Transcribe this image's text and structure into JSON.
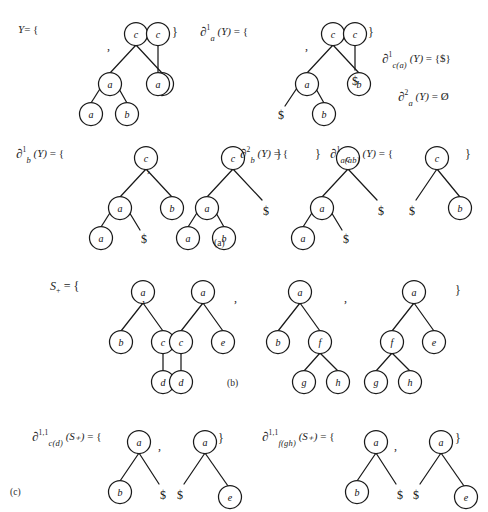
{
  "figure": {
    "title_absent": true,
    "background_color": "#ffffff",
    "ink_color": "#1a1a1a",
    "node_label_style": "italic-serif",
    "end_marker": "$",
    "empty_set_symbol": "Ø"
  },
  "panels": [
    {
      "id": "a",
      "caption": "(a)",
      "rows": [
        {
          "entries": [
            {
              "label": {
                "base": "Y",
                "sup": "",
                "sub": "",
                "arg": "",
                "eq": "= {"
              },
              "label_text": "Y = {",
              "trees": [
                {
                  "nodes": [
                    {
                      "id": "n1",
                      "label": "c",
                      "x": 62,
                      "y": 10
                    },
                    {
                      "id": "n2",
                      "label": "a",
                      "x": 36,
                      "y": 45
                    },
                    {
                      "id": "n3",
                      "label": "b",
                      "x": 92,
                      "y": 45
                    },
                    {
                      "id": "n4",
                      "label": "a",
                      "x": 17,
                      "y": 82
                    },
                    {
                      "id": "n5",
                      "label": "b",
                      "x": 53,
                      "y": 82
                    }
                  ],
                  "edges": [
                    [
                      "n1",
                      "n2"
                    ],
                    [
                      "n1",
                      "n3"
                    ],
                    [
                      "n2",
                      "n4"
                    ],
                    [
                      "n2",
                      "n5"
                    ]
                  ]
                },
                {
                  "nodes": [
                    {
                      "id": "m1",
                      "label": "c",
                      "x": 12,
                      "y": 10
                    },
                    {
                      "id": "m2",
                      "label": "a",
                      "x": 12,
                      "y": 45
                    }
                  ],
                  "edges": [
                    [
                      "m1",
                      "m2"
                    ]
                  ]
                }
              ],
              "separators": [
                ","
              ],
              "closing": "}"
            },
            {
              "label_text": "∂¹a (Y) = {",
              "label": {
                "base": "∂",
                "sup": "1",
                "sub": "a",
                "arg": "(Y)",
                "eq": "= {"
              },
              "trees": [
                {
                  "nodes": [
                    {
                      "id": "p1",
                      "label": "c",
                      "x": 62,
                      "y": 10
                    },
                    {
                      "id": "p2",
                      "label": "a",
                      "x": 36,
                      "y": 45
                    },
                    {
                      "id": "p3",
                      "label": "b",
                      "x": 92,
                      "y": 45
                    },
                    {
                      "id": "p4",
                      "label": "$",
                      "x": 14,
                      "y": 82,
                      "leaf": true
                    },
                    {
                      "id": "p5",
                      "label": "b",
                      "x": 53,
                      "y": 82
                    }
                  ],
                  "edges": [
                    [
                      "p1",
                      "p2"
                    ],
                    [
                      "p1",
                      "p3"
                    ],
                    [
                      "p2",
                      "p4"
                    ],
                    [
                      "p2",
                      "p5"
                    ]
                  ]
                },
                {
                  "nodes": [
                    {
                      "id": "q1",
                      "label": "c",
                      "x": 12,
                      "y": 10
                    },
                    {
                      "id": "q2",
                      "label": "$",
                      "x": 12,
                      "y": 45,
                      "leaf": true
                    }
                  ],
                  "edges": [
                    [
                      "q1",
                      "q2"
                    ]
                  ]
                }
              ],
              "separators": [
                ","
              ],
              "closing": "}"
            }
          ]
        }
      ],
      "side_equations": [
        {
          "label": {
            "base": "∂",
            "sup": "1",
            "sub": "c(a)",
            "arg": "(Y)"
          },
          "rhs": "= {$}",
          "text": "∂¹c(a) (Y) = {$}"
        },
        {
          "label": {
            "base": "∂",
            "sup": "2",
            "sub": "a",
            "arg": "(Y)"
          },
          "rhs": "= Ø",
          "text": "∂²a (Y) = Ø"
        }
      ],
      "row2": [
        {
          "label_text": "∂¹b (Y) = {",
          "label": {
            "base": "∂",
            "sup": "1",
            "sub": "b",
            "arg": "(Y)",
            "eq": "= {"
          },
          "trees": [
            {
              "nodes": [
                {
                  "id": "r1",
                  "label": "c",
                  "x": 62,
                  "y": 10
                },
                {
                  "id": "r2",
                  "label": "a",
                  "x": 36,
                  "y": 45
                },
                {
                  "id": "r3",
                  "label": "b",
                  "x": 92,
                  "y": 45
                },
                {
                  "id": "r4",
                  "label": "a",
                  "x": 17,
                  "y": 82
                },
                {
                  "id": "r5",
                  "label": "$",
                  "x": 52,
                  "y": 84,
                  "leaf": true
                }
              ],
              "edges": [
                [
                  "r1",
                  "r2"
                ],
                [
                  "r1",
                  "r3"
                ],
                [
                  "r2",
                  "r4"
                ],
                [
                  "r2",
                  "r5"
                ]
              ]
            },
            {
              "nodes": [
                {
                  "id": "s1",
                  "label": "c",
                  "x": 62,
                  "y": 10
                },
                {
                  "id": "s2",
                  "label": "a",
                  "x": 36,
                  "y": 45
                },
                {
                  "id": "s3",
                  "label": "$",
                  "x": 94,
                  "y": 50,
                  "leaf": true
                },
                {
                  "id": "s4",
                  "label": "a",
                  "x": 17,
                  "y": 82
                },
                {
                  "id": "s5",
                  "label": "b",
                  "x": 53,
                  "y": 82
                }
              ],
              "edges": [
                [
                  "s1",
                  "s2"
                ],
                [
                  "s1",
                  "s3"
                ],
                [
                  "s2",
                  "s4"
                ],
                [
                  "s2",
                  "s5"
                ]
              ]
            }
          ],
          "separators": [
            ","
          ],
          "closing": "}"
        },
        {
          "label_text": "∂²b (Y) = {",
          "label": {
            "base": "∂",
            "sup": "2",
            "sub": "b",
            "arg": "(Y)",
            "eq": "= {"
          },
          "trees": [
            {
              "nodes": [
                {
                  "id": "t1",
                  "label": "c",
                  "x": 48,
                  "y": 10
                },
                {
                  "id": "t2",
                  "label": "a",
                  "x": 22,
                  "y": 45
                },
                {
                  "id": "t3",
                  "label": "$",
                  "x": 80,
                  "y": 50,
                  "leaf": true
                },
                {
                  "id": "t4",
                  "label": "a",
                  "x": 6,
                  "y": 82
                },
                {
                  "id": "t5",
                  "label": "$",
                  "x": 40,
                  "y": 84,
                  "leaf": true
                }
              ],
              "edges": [
                [
                  "t1",
                  "t2"
                ],
                [
                  "t1",
                  "t3"
                ],
                [
                  "t2",
                  "t4"
                ],
                [
                  "t2",
                  "t5"
                ]
              ]
            }
          ],
          "separators": [],
          "closing": "}"
        },
        {
          "label_text": "∂¹a(ab) (Y) = {",
          "label": {
            "base": "∂",
            "sup": "1",
            "sub": "a(ab)",
            "arg": "(Y)",
            "eq": "= {"
          },
          "trees": [
            {
              "nodes": [
                {
                  "id": "u1",
                  "label": "c",
                  "x": 36,
                  "y": 10
                },
                {
                  "id": "u2",
                  "label": "$",
                  "x": 12,
                  "y": 50,
                  "leaf": true
                },
                {
                  "id": "u3",
                  "label": "b",
                  "x": 62,
                  "y": 45
                }
              ],
              "edges": [
                [
                  "u1",
                  "u2"
                ],
                [
                  "u1",
                  "u3"
                ]
              ]
            }
          ],
          "separators": [],
          "closing": "}"
        }
      ]
    },
    {
      "id": "b",
      "caption": "(b)",
      "label_text": "S+ = {",
      "label": {
        "base": "S",
        "sub": "+",
        "eq": "= {"
      },
      "trees": [
        {
          "nodes": [
            {
              "id": "b1",
              "label": "a",
              "x": 32,
              "y": 10
            },
            {
              "id": "b2",
              "label": "b",
              "x": 10,
              "y": 45
            },
            {
              "id": "b3",
              "label": "c",
              "x": 52,
              "y": 45
            },
            {
              "id": "b4",
              "label": "d",
              "x": 52,
              "y": 82
            }
          ],
          "edges": [
            [
              "b1",
              "b2"
            ],
            [
              "b1",
              "b3"
            ],
            [
              "b3",
              "b4"
            ]
          ]
        },
        {
          "nodes": [
            {
              "id": "c1",
              "label": "a",
              "x": 32,
              "y": 10
            },
            {
              "id": "c2",
              "label": "c",
              "x": 10,
              "y": 45
            },
            {
              "id": "c3",
              "label": "e",
              "x": 52,
              "y": 45
            },
            {
              "id": "c4",
              "label": "d",
              "x": 10,
              "y": 82
            }
          ],
          "edges": [
            [
              "c1",
              "c2"
            ],
            [
              "c1",
              "c3"
            ],
            [
              "c2",
              "c4"
            ]
          ]
        },
        {
          "nodes": [
            {
              "id": "d1",
              "label": "a",
              "x": 32,
              "y": 10
            },
            {
              "id": "d2",
              "label": "b",
              "x": 10,
              "y": 45
            },
            {
              "id": "d3",
              "label": "f",
              "x": 52,
              "y": 45
            },
            {
              "id": "d4",
              "label": "g",
              "x": 36,
              "y": 82
            },
            {
              "id": "d5",
              "label": "h",
              "x": 70,
              "y": 82
            }
          ],
          "edges": [
            [
              "d1",
              "d2"
            ],
            [
              "d1",
              "d3"
            ],
            [
              "d3",
              "d4"
            ],
            [
              "d3",
              "d5"
            ]
          ]
        },
        {
          "nodes": [
            {
              "id": "e1",
              "label": "a",
              "x": 38,
              "y": 10
            },
            {
              "id": "e2",
              "label": "f",
              "x": 16,
              "y": 45
            },
            {
              "id": "e3",
              "label": "e",
              "x": 58,
              "y": 45
            },
            {
              "id": "e4",
              "label": "g",
              "x": 2,
              "y": 82
            },
            {
              "id": "e5",
              "label": "h",
              "x": 36,
              "y": 82
            }
          ],
          "edges": [
            [
              "e1",
              "e2"
            ],
            [
              "e1",
              "e3"
            ],
            [
              "e2",
              "e4"
            ],
            [
              "e2",
              "e5"
            ]
          ]
        }
      ],
      "separators": [
        ",",
        ",",
        ","
      ],
      "closing": "}"
    },
    {
      "id": "c",
      "caption": "(c)",
      "entries": [
        {
          "label_text": "∂1,1c(d) (S+) = {",
          "label": {
            "base": "∂",
            "sup": "1,1",
            "sub": "c(d)",
            "arg": "(S+)",
            "eq": "= {"
          },
          "trees": [
            {
              "nodes": [
                {
                  "id": "f1",
                  "label": "a",
                  "x": 26,
                  "y": 10
                },
                {
                  "id": "f2",
                  "label": "b",
                  "x": 6,
                  "y": 45
                },
                {
                  "id": "f3",
                  "label": "$",
                  "x": 46,
                  "y": 47,
                  "leaf": true
                }
              ],
              "edges": [
                [
                  "f1",
                  "f2"
                ],
                [
                  "f1",
                  "f3"
                ]
              ]
            },
            {
              "nodes": [
                {
                  "id": "g1",
                  "label": "a",
                  "x": 26,
                  "y": 10
                },
                {
                  "id": "g2",
                  "label": "$",
                  "x": 4,
                  "y": 47,
                  "leaf": true
                },
                {
                  "id": "g3",
                  "label": "e",
                  "x": 48,
                  "y": 49
                }
              ],
              "edges": [
                [
                  "g1",
                  "g2"
                ],
                [
                  "g1",
                  "g3"
                ]
              ]
            }
          ],
          "separators": [
            ","
          ],
          "closing": "}"
        },
        {
          "label_text": "∂1,1f(gh) (S+) = {",
          "label": {
            "base": "∂",
            "sup": "1,1",
            "sub": "f(gh)",
            "arg": "(S+)",
            "eq": "= {"
          },
          "trees": [
            {
              "nodes": [
                {
                  "id": "h1",
                  "label": "a",
                  "x": 26,
                  "y": 10
                },
                {
                  "id": "h2",
                  "label": "b",
                  "x": 6,
                  "y": 45
                },
                {
                  "id": "h3",
                  "label": "$",
                  "x": 46,
                  "y": 47,
                  "leaf": true
                }
              ],
              "edges": [
                [
                  "h1",
                  "h2"
                ],
                [
                  "h1",
                  "h3"
                ]
              ]
            },
            {
              "nodes": [
                {
                  "id": "i1",
                  "label": "a",
                  "x": 26,
                  "y": 10
                },
                {
                  "id": "i2",
                  "label": "$",
                  "x": 4,
                  "y": 47,
                  "leaf": true
                },
                {
                  "id": "i3",
                  "label": "e",
                  "x": 48,
                  "y": 49
                }
              ],
              "edges": [
                [
                  "i1",
                  "i2"
                ],
                [
                  "i1",
                  "i3"
                ]
              ]
            }
          ],
          "separators": [
            ","
          ],
          "closing": "}"
        }
      ]
    }
  ],
  "labels": {
    "Y_set": "Y = {",
    "d1a": "∂¹a (Y) = {",
    "d1ca": "∂¹c(a) (Y) = {$}",
    "d2a": "∂²a (Y) = Ø",
    "d1b": "∂¹b (Y) = {",
    "d2b": "∂²b (Y) = {",
    "d1aab": "∂¹a(ab) (Y) = {",
    "Splus": "S+ = {",
    "d11cd": "∂1,1c(d) (S+) = {",
    "d11fgh": "∂1,1f(gh) (S+) = {",
    "caption_a": "(a)",
    "caption_b": "(b)",
    "caption_c": "(c)",
    "comma": ",",
    "close_brace": "}",
    "open_brace": "{",
    "dollar": "$",
    "emptyset": "Ø",
    "sup_1": "1",
    "sup_2": "2",
    "sup_11": "1,1",
    "sub_a": "a",
    "sub_b": "b",
    "sub_ca": "c(a)",
    "sub_aab": "a(ab)",
    "sub_cd": "c(d)",
    "sub_fgh": "f(gh)",
    "arg_Y": "(Y)",
    "arg_Splus": "(S₊)",
    "eq_open": "= {",
    "eq_set_dollar": "= {$}",
    "eq_emptyset": "= Ø",
    "partial": "∂",
    "Y": "Y",
    "S": "S",
    "plus": "+"
  },
  "node_labels": {
    "a": "a",
    "b": "b",
    "c": "c",
    "d": "d",
    "e": "e",
    "f": "f",
    "g": "g",
    "h": "h",
    "dollar": "$"
  }
}
